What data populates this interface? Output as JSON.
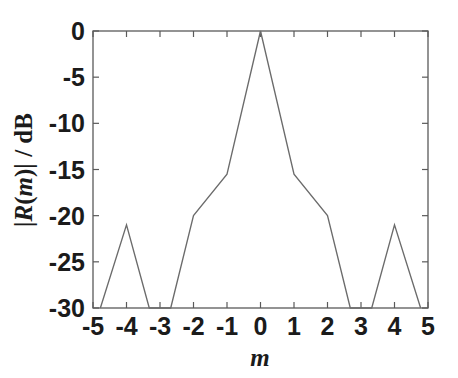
{
  "figure": {
    "width": 458,
    "height": 378,
    "background": "#ffffff",
    "line_color": "#6b6b6b",
    "axis_color": "#5a5a5a",
    "text_color": "#1b1b1b"
  },
  "axes": {
    "xlabel_parts": {
      "italic": "m"
    },
    "ylabel_parts": {
      "bar_open": "|",
      "italic_r": "R",
      "paren_open": "(",
      "italic_m": "m",
      "paren_close": ")",
      "bar_close": "|",
      "unit": " / dB"
    },
    "x_tick_labels": [
      "-5",
      "-4",
      "-3",
      "-2",
      "-1",
      "0",
      "1",
      "2",
      "3",
      "4",
      "5"
    ],
    "y_tick_labels": [
      "0",
      "-5",
      "-10",
      "-15",
      "-20",
      "-25",
      "-30"
    ]
  },
  "chart_data": {
    "type": "line",
    "title": "",
    "xlabel": "m",
    "ylabel": "|R(m)| / dB",
    "xlim": [
      -5,
      5
    ],
    "ylim": [
      -30,
      0
    ],
    "xticks": [
      -5,
      -4,
      -3,
      -2,
      -1,
      0,
      1,
      2,
      3,
      4,
      5
    ],
    "yticks": [
      -30,
      -25,
      -20,
      -15,
      -10,
      -5,
      0
    ],
    "grid": false,
    "legend": null,
    "legend_position": "none",
    "box": true,
    "tick_direction": "in",
    "series": [
      {
        "name": "|R(m)|",
        "color": "#6b6b6b",
        "note": "Symmetric autocorrelation magnitude in dB; values below -30 dB are clipped at the axis floor.",
        "x": [
          -4.78,
          -4.0,
          -3.32,
          -2.68,
          -2.0,
          -1.0,
          0.0,
          1.0,
          2.0,
          2.68,
          3.32,
          4.0,
          4.78
        ],
        "y": [
          -30.0,
          -21.0,
          -30.0,
          -30.0,
          -20.0,
          -15.5,
          0.0,
          -15.5,
          -20.0,
          -30.0,
          -30.0,
          -21.0,
          -30.0
        ]
      }
    ],
    "annotations": []
  }
}
